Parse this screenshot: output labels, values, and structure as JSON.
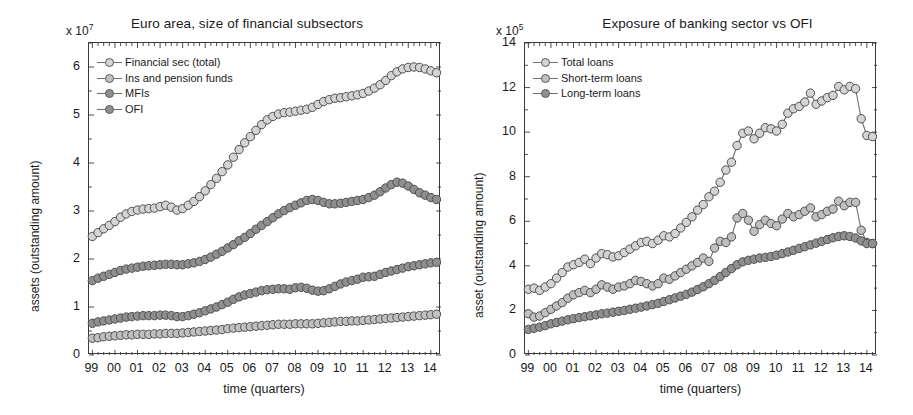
{
  "figure": {
    "panels": [
      {
        "id": "left",
        "title": "Euro area, size of financial subsectors",
        "exponent_prefix": "x 10",
        "exponent_power": "7",
        "ylabel": "assets (outstanding amount)",
        "xlabel": "time (quarters)",
        "legend": [
          {
            "label": "Financial sec (total)",
            "color": "#d4d4d4"
          },
          {
            "label": "Ins and pension funds",
            "color": "#c0c0c0"
          },
          {
            "label": "MFIs",
            "color": "#8f8f8f"
          },
          {
            "label": "OFI",
            "color": "#8f8f8f"
          }
        ]
      },
      {
        "id": "right",
        "title": "Exposure of banking sector vs OFI",
        "exponent_prefix": "x 10",
        "exponent_power": "5",
        "ylabel": "asset (outstanding amount)",
        "xlabel": "time (quarters)",
        "legend": [
          {
            "label": "Total loans",
            "color": "#d4d4d4"
          },
          {
            "label": "Short-term loans",
            "color": "#c0c0c0"
          },
          {
            "label": "Long-term loans",
            "color": "#8f8f8f"
          }
        ]
      }
    ]
  },
  "chart_data": [
    {
      "type": "line",
      "panel": "left",
      "title": "Euro area, size of financial subsectors",
      "xlabel": "time (quarters)",
      "ylabel": "assets (outstanding amount)",
      "y_exponent": "x 10^7",
      "grid": false,
      "legend_position": "top-left",
      "xlim": [
        1998.85,
        2014.45
      ],
      "ylim": [
        0,
        6.5
      ],
      "yticks": [
        0,
        1,
        2,
        3,
        4,
        5,
        6
      ],
      "xticks": [
        1999,
        2000,
        2001,
        2002,
        2003,
        2004,
        2005,
        2006,
        2007,
        2008,
        2009,
        2010,
        2011,
        2012,
        2013,
        2014
      ],
      "xticklabels": [
        "99",
        "00",
        "01",
        "02",
        "03",
        "04",
        "05",
        "06",
        "07",
        "08",
        "09",
        "10",
        "11",
        "12",
        "13",
        "14"
      ],
      "x": [
        1999.0,
        1999.25,
        1999.5,
        1999.75,
        2000.0,
        2000.25,
        2000.5,
        2000.75,
        2001.0,
        2001.25,
        2001.5,
        2001.75,
        2002.0,
        2002.25,
        2002.5,
        2002.75,
        2003.0,
        2003.25,
        2003.5,
        2003.75,
        2004.0,
        2004.25,
        2004.5,
        2004.75,
        2005.0,
        2005.25,
        2005.5,
        2005.75,
        2006.0,
        2006.25,
        2006.5,
        2006.75,
        2007.0,
        2007.25,
        2007.5,
        2007.75,
        2008.0,
        2008.25,
        2008.5,
        2008.75,
        2009.0,
        2009.25,
        2009.5,
        2009.75,
        2010.0,
        2010.25,
        2010.5,
        2010.75,
        2011.0,
        2011.25,
        2011.5,
        2011.75,
        2012.0,
        2012.25,
        2012.5,
        2012.75,
        2013.0,
        2013.25,
        2013.5,
        2013.75,
        2014.0,
        2014.25
      ],
      "series": [
        {
          "name": "Financial sec (total)",
          "color": "#d4d4d4",
          "values": [
            2.47,
            2.55,
            2.63,
            2.7,
            2.78,
            2.87,
            2.94,
            2.99,
            3.02,
            3.04,
            3.05,
            3.06,
            3.09,
            3.12,
            3.08,
            3.02,
            3.05,
            3.12,
            3.2,
            3.3,
            3.42,
            3.55,
            3.68,
            3.82,
            3.96,
            4.12,
            4.28,
            4.42,
            4.55,
            4.68,
            4.8,
            4.9,
            4.97,
            5.02,
            5.05,
            5.06,
            5.08,
            5.1,
            5.12,
            5.16,
            5.22,
            5.28,
            5.32,
            5.35,
            5.36,
            5.38,
            5.4,
            5.42,
            5.45,
            5.5,
            5.56,
            5.63,
            5.72,
            5.82,
            5.9,
            5.96,
            5.99,
            6.0,
            5.99,
            5.96,
            5.92,
            5.88
          ]
        },
        {
          "name": "Ins and pension funds",
          "color": "#c0c0c0",
          "values": [
            0.35,
            0.36,
            0.38,
            0.39,
            0.4,
            0.41,
            0.42,
            0.42,
            0.43,
            0.43,
            0.43,
            0.44,
            0.44,
            0.45,
            0.45,
            0.45,
            0.46,
            0.47,
            0.48,
            0.49,
            0.5,
            0.51,
            0.52,
            0.53,
            0.55,
            0.56,
            0.57,
            0.58,
            0.59,
            0.6,
            0.61,
            0.62,
            0.63,
            0.64,
            0.64,
            0.64,
            0.65,
            0.65,
            0.65,
            0.65,
            0.66,
            0.67,
            0.68,
            0.69,
            0.7,
            0.7,
            0.71,
            0.71,
            0.72,
            0.73,
            0.74,
            0.75,
            0.76,
            0.77,
            0.78,
            0.79,
            0.8,
            0.81,
            0.82,
            0.83,
            0.84,
            0.85
          ]
        },
        {
          "name": "MFIs",
          "color": "#8f8f8f",
          "values": [
            1.55,
            1.6,
            1.64,
            1.68,
            1.72,
            1.76,
            1.79,
            1.81,
            1.83,
            1.85,
            1.86,
            1.87,
            1.88,
            1.89,
            1.89,
            1.88,
            1.88,
            1.9,
            1.92,
            1.95,
            1.99,
            2.04,
            2.1,
            2.16,
            2.23,
            2.3,
            2.38,
            2.45,
            2.53,
            2.62,
            2.7,
            2.78,
            2.86,
            2.94,
            3.01,
            3.07,
            3.12,
            3.17,
            3.22,
            3.24,
            3.22,
            3.18,
            3.15,
            3.15,
            3.16,
            3.18,
            3.2,
            3.22,
            3.24,
            3.28,
            3.33,
            3.4,
            3.48,
            3.55,
            3.6,
            3.58,
            3.52,
            3.45,
            3.38,
            3.33,
            3.28,
            3.24
          ]
        },
        {
          "name": "OFI",
          "color": "#8f8f8f",
          "values": [
            0.66,
            0.69,
            0.71,
            0.73,
            0.75,
            0.77,
            0.79,
            0.8,
            0.81,
            0.82,
            0.82,
            0.82,
            0.83,
            0.83,
            0.82,
            0.8,
            0.8,
            0.82,
            0.85,
            0.88,
            0.92,
            0.96,
            1.0,
            1.05,
            1.1,
            1.16,
            1.21,
            1.25,
            1.28,
            1.31,
            1.34,
            1.36,
            1.37,
            1.38,
            1.38,
            1.37,
            1.4,
            1.41,
            1.39,
            1.35,
            1.33,
            1.34,
            1.38,
            1.43,
            1.48,
            1.52,
            1.55,
            1.58,
            1.62,
            1.63,
            1.64,
            1.68,
            1.72,
            1.75,
            1.78,
            1.81,
            1.84,
            1.86,
            1.88,
            1.9,
            1.92,
            1.93
          ]
        }
      ]
    },
    {
      "type": "line",
      "panel": "right",
      "title": "Exposure of banking sector vs OFI",
      "xlabel": "time (quarters)",
      "ylabel": "asset (outstanding amount)",
      "y_exponent": "x 10^5",
      "grid": false,
      "legend_position": "top-left",
      "xlim": [
        1998.85,
        2014.45
      ],
      "ylim": [
        0,
        14
      ],
      "yticks": [
        0,
        2,
        4,
        6,
        8,
        10,
        12,
        14
      ],
      "xticks": [
        1999,
        2000,
        2001,
        2002,
        2003,
        2004,
        2005,
        2006,
        2007,
        2008,
        2009,
        2010,
        2011,
        2012,
        2013,
        2014
      ],
      "xticklabels": [
        "99",
        "00",
        "01",
        "02",
        "03",
        "04",
        "05",
        "06",
        "07",
        "08",
        "09",
        "10",
        "11",
        "12",
        "13",
        "14"
      ],
      "x": [
        1999.0,
        1999.25,
        1999.5,
        1999.75,
        2000.0,
        2000.25,
        2000.5,
        2000.75,
        2001.0,
        2001.25,
        2001.5,
        2001.75,
        2002.0,
        2002.25,
        2002.5,
        2002.75,
        2003.0,
        2003.25,
        2003.5,
        2003.75,
        2004.0,
        2004.25,
        2004.5,
        2004.75,
        2005.0,
        2005.25,
        2005.5,
        2005.75,
        2006.0,
        2006.25,
        2006.5,
        2006.75,
        2007.0,
        2007.25,
        2007.5,
        2007.75,
        2008.0,
        2008.25,
        2008.5,
        2008.75,
        2009.0,
        2009.25,
        2009.5,
        2009.75,
        2010.0,
        2010.25,
        2010.5,
        2010.75,
        2011.0,
        2011.25,
        2011.5,
        2011.75,
        2012.0,
        2012.25,
        2012.5,
        2012.75,
        2013.0,
        2013.25,
        2013.5,
        2013.75,
        2014.0,
        2014.25
      ],
      "series": [
        {
          "name": "Total loans",
          "color": "#d4d4d4",
          "values": [
            2.95,
            3.0,
            2.9,
            3.05,
            3.2,
            3.45,
            3.7,
            3.95,
            4.05,
            4.15,
            4.3,
            4.1,
            4.35,
            4.55,
            4.5,
            4.4,
            4.45,
            4.6,
            4.75,
            4.9,
            5.05,
            5.1,
            5.0,
            5.15,
            5.35,
            5.3,
            5.45,
            5.7,
            5.95,
            6.2,
            6.5,
            6.75,
            7.1,
            7.35,
            7.75,
            8.3,
            8.65,
            9.4,
            9.95,
            10.05,
            9.7,
            9.95,
            10.2,
            10.15,
            10.05,
            10.35,
            10.85,
            11.05,
            11.15,
            11.35,
            11.75,
            11.25,
            11.4,
            11.55,
            11.65,
            12.05,
            11.9,
            12.05,
            11.95,
            10.6,
            9.85,
            9.8
          ]
        },
        {
          "name": "Short-term loans",
          "color": "#c0c0c0",
          "values": [
            1.85,
            1.7,
            1.75,
            1.9,
            2.05,
            2.2,
            2.35,
            2.55,
            2.7,
            2.8,
            2.9,
            2.8,
            2.95,
            3.15,
            3.05,
            2.95,
            3.05,
            3.1,
            3.2,
            3.35,
            3.3,
            3.2,
            3.1,
            3.2,
            3.45,
            3.4,
            3.55,
            3.7,
            3.85,
            4.0,
            4.15,
            4.35,
            4.2,
            4.8,
            5.1,
            5.05,
            5.3,
            6.15,
            6.35,
            6.05,
            5.55,
            5.85,
            6.05,
            5.9,
            5.8,
            6.1,
            6.35,
            6.2,
            6.3,
            6.45,
            6.6,
            6.2,
            6.3,
            6.45,
            6.55,
            6.9,
            6.7,
            6.85,
            6.85,
            5.6,
            5.05,
            5.0
          ]
        },
        {
          "name": "Long-term loans",
          "color": "#8f8f8f",
          "values": [
            1.15,
            1.2,
            1.25,
            1.32,
            1.4,
            1.46,
            1.52,
            1.58,
            1.63,
            1.68,
            1.72,
            1.76,
            1.8,
            1.85,
            1.88,
            1.92,
            1.96,
            2.0,
            2.05,
            2.1,
            2.15,
            2.2,
            2.26,
            2.32,
            2.4,
            2.48,
            2.56,
            2.64,
            2.72,
            2.82,
            2.94,
            3.06,
            3.2,
            3.35,
            3.52,
            3.7,
            3.88,
            4.05,
            4.18,
            4.25,
            4.3,
            4.35,
            4.38,
            4.42,
            4.48,
            4.55,
            4.62,
            4.7,
            4.78,
            4.86,
            4.94,
            5.02,
            5.1,
            5.18,
            5.26,
            5.32,
            5.35,
            5.32,
            5.25,
            5.12,
            5.0,
            5.0
          ]
        }
      ]
    }
  ]
}
